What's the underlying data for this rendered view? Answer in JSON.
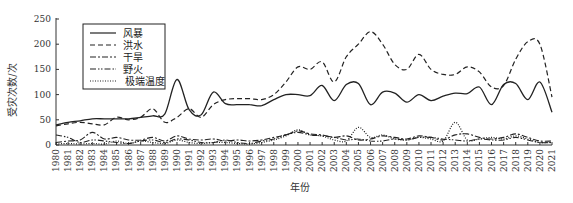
{
  "chart_data": {
    "type": "line",
    "title": "",
    "xlabel": "年份",
    "ylabel": "受灾次数/次",
    "ylim": [
      0,
      250
    ],
    "yticks": [
      0,
      50,
      100,
      150,
      200,
      250
    ],
    "grid": false,
    "legend_position": "upper-left",
    "x": [
      1980,
      1981,
      1982,
      1983,
      1984,
      1985,
      1986,
      1987,
      1988,
      1989,
      1990,
      1991,
      1992,
      1993,
      1994,
      1995,
      1996,
      1997,
      1998,
      1999,
      2000,
      2001,
      2002,
      2003,
      2004,
      2005,
      2006,
      2007,
      2008,
      2009,
      2010,
      2011,
      2012,
      2013,
      2014,
      2015,
      2016,
      2017,
      2018,
      2019,
      2020,
      2021
    ],
    "series": [
      {
        "name": "风暴",
        "style": "solid",
        "values": [
          40,
          45,
          48,
          52,
          52,
          52,
          52,
          55,
          58,
          62,
          130,
          70,
          60,
          105,
          82,
          80,
          80,
          78,
          90,
          100,
          100,
          98,
          118,
          88,
          120,
          122,
          80,
          105,
          103,
          85,
          100,
          88,
          97,
          103,
          102,
          115,
          80,
          120,
          122,
          90,
          125,
          65
        ]
      },
      {
        "name": "洪水",
        "style": "dashed",
        "values": [
          38,
          42,
          45,
          42,
          40,
          55,
          50,
          55,
          72,
          45,
          55,
          72,
          55,
          80,
          90,
          92,
          92,
          90,
          100,
          125,
          155,
          150,
          165,
          125,
          175,
          200,
          225,
          200,
          160,
          150,
          180,
          150,
          140,
          140,
          155,
          145,
          115,
          118,
          170,
          205,
          200,
          95
        ]
      },
      {
        "name": "干旱",
        "style": "dashdot",
        "values": [
          5,
          8,
          10,
          25,
          12,
          15,
          10,
          10,
          15,
          8,
          18,
          12,
          10,
          12,
          8,
          10,
          8,
          10,
          15,
          20,
          28,
          22,
          20,
          15,
          18,
          10,
          12,
          18,
          15,
          12,
          18,
          15,
          10,
          20,
          22,
          15,
          12,
          15,
          22,
          15,
          8,
          8
        ]
      },
      {
        "name": "野火",
        "style": "dashdotdot",
        "values": [
          20,
          15,
          5,
          10,
          8,
          5,
          3,
          8,
          10,
          5,
          12,
          10,
          5,
          5,
          10,
          5,
          3,
          8,
          12,
          20,
          25,
          20,
          18,
          15,
          10,
          12,
          8,
          8,
          12,
          10,
          15,
          15,
          12,
          10,
          8,
          12,
          10,
          10,
          15,
          10,
          5,
          5
        ]
      },
      {
        "name": "极端温度",
        "style": "dotted",
        "values": [
          2,
          3,
          2,
          3,
          2,
          8,
          3,
          8,
          5,
          3,
          10,
          5,
          3,
          5,
          5,
          3,
          2,
          5,
          10,
          18,
          30,
          20,
          18,
          10,
          8,
          35,
          15,
          20,
          12,
          10,
          15,
          12,
          8,
          45,
          10,
          12,
          15,
          12,
          18,
          12,
          5,
          5
        ]
      }
    ]
  },
  "legend": {
    "items": [
      {
        "label": "风暴",
        "dash": ""
      },
      {
        "label": "洪水",
        "dash": "5,3"
      },
      {
        "label": "干旱",
        "dash": "6,2,2,2"
      },
      {
        "label": "野火",
        "dash": "6,2,1.5,1.5,1.5,2"
      },
      {
        "label": "极端温度",
        "dash": "1,1.5"
      }
    ]
  },
  "axes": {
    "xlabel": "年份",
    "ylabel": "受灾次数/次",
    "yticks": [
      "0",
      "50",
      "100",
      "150",
      "200",
      "250"
    ]
  }
}
